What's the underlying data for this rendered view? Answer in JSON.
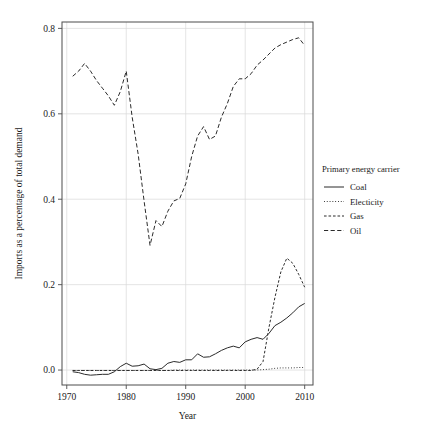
{
  "chart_data": {
    "type": "line",
    "title": "",
    "xlabel": "Year",
    "ylabel": "Imports as a percentage of total demand",
    "xlim": [
      1969.2,
      2011.4
    ],
    "ylim": [
      -0.035,
      0.815
    ],
    "xticks": [
      1970,
      1980,
      1990,
      2000,
      2010
    ],
    "xticklabels": [
      "1970",
      "1980",
      "1990",
      "2000",
      "2010"
    ],
    "yticks": [
      0.0,
      0.2,
      0.4,
      0.6,
      0.8
    ],
    "yticklabels": [
      "0.0",
      "0.2",
      "0.4",
      "0.6",
      "0.8"
    ],
    "grid": true,
    "legend_position": "right",
    "legend_title": "Primary energy carrier",
    "x": [
      1971,
      1972,
      1973,
      1974,
      1975,
      1976,
      1977,
      1978,
      1979,
      1980,
      1981,
      1982,
      1983,
      1984,
      1985,
      1986,
      1987,
      1988,
      1989,
      1990,
      1991,
      1992,
      1993,
      1994,
      1995,
      1996,
      1997,
      1998,
      1999,
      2000,
      2001,
      2002,
      2003,
      2004,
      2005,
      2006,
      2007,
      2008,
      2009,
      2010
    ],
    "series": [
      {
        "name": "Coal",
        "dash": "solid",
        "values": [
          -0.004,
          -0.006,
          -0.01,
          -0.012,
          -0.011,
          -0.01,
          -0.01,
          -0.004,
          0.008,
          0.016,
          0.009,
          0.01,
          0.014,
          0.003,
          0.001,
          0.004,
          0.016,
          0.02,
          0.018,
          0.024,
          0.024,
          0.038,
          0.03,
          0.031,
          0.038,
          0.046,
          0.052,
          0.056,
          0.052,
          0.066,
          0.072,
          0.076,
          0.072,
          0.086,
          0.104,
          0.112,
          0.122,
          0.134,
          0.148,
          0.156
        ]
      },
      {
        "name": "Electicity",
        "dash": "dotted",
        "values": [
          -0.001,
          -0.001,
          -0.001,
          -0.001,
          -0.001,
          -0.001,
          -0.001,
          -0.001,
          -0.001,
          -0.001,
          -0.001,
          -0.001,
          -0.001,
          -0.001,
          -0.001,
          -0.001,
          -0.001,
          0.0,
          0.0,
          0.0,
          0.0,
          0.0,
          0.0,
          0.0,
          0.0,
          0.0,
          0.0,
          0.0,
          0.0,
          0.0,
          0.0,
          0.0,
          0.001,
          0.002,
          0.004,
          0.005,
          0.005,
          0.005,
          0.006,
          0.006
        ]
      },
      {
        "name": "Gas",
        "dash": "dashed-short",
        "values": [
          -0.001,
          -0.001,
          -0.001,
          -0.001,
          -0.001,
          -0.001,
          -0.001,
          -0.001,
          -0.001,
          -0.001,
          -0.001,
          -0.001,
          -0.001,
          -0.001,
          -0.001,
          -0.001,
          -0.001,
          -0.001,
          -0.001,
          -0.001,
          -0.001,
          -0.001,
          -0.001,
          -0.001,
          -0.001,
          -0.001,
          -0.001,
          -0.001,
          -0.001,
          -0.001,
          -0.001,
          0.002,
          0.02,
          0.1,
          0.17,
          0.23,
          0.262,
          0.25,
          0.224,
          0.194
        ]
      },
      {
        "name": "Oil",
        "dash": "dashed-long",
        "values": [
          0.688,
          0.7,
          0.718,
          0.7,
          0.678,
          0.66,
          0.642,
          0.62,
          0.652,
          0.7,
          0.592,
          0.506,
          0.396,
          0.292,
          0.35,
          0.336,
          0.372,
          0.396,
          0.402,
          0.436,
          0.5,
          0.548,
          0.57,
          0.54,
          0.548,
          0.592,
          0.624,
          0.664,
          0.682,
          0.682,
          0.694,
          0.714,
          0.726,
          0.74,
          0.754,
          0.762,
          0.768,
          0.774,
          0.778,
          0.76
        ]
      }
    ]
  },
  "legend": {
    "title": "Primary energy carrier",
    "items": [
      {
        "label": "Coal",
        "dash": "solid"
      },
      {
        "label": "Electicity",
        "dash": "dotted"
      },
      {
        "label": "Gas",
        "dash": "dashed-short"
      },
      {
        "label": "Oil",
        "dash": "dashed-long"
      }
    ]
  },
  "axes": {
    "x_title": "Year",
    "y_title": "Imports as a percentage of total demand"
  }
}
